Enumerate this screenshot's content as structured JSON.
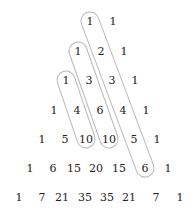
{
  "rows": [
    {
      "y": 21,
      "cells": [
        {
          "v": "1",
          "x": 90
        },
        {
          "v": "1",
          "x": 113
        }
      ]
    },
    {
      "y": 51,
      "cells": [
        {
          "v": "1",
          "x": 78
        },
        {
          "v": "2",
          "x": 101
        },
        {
          "v": "1",
          "x": 124
        }
      ]
    },
    {
      "y": 80,
      "cells": [
        {
          "v": "1",
          "x": 66
        },
        {
          "v": "3",
          "x": 89
        },
        {
          "v": "3",
          "x": 112
        },
        {
          "v": "1",
          "x": 135
        }
      ]
    },
    {
      "y": 110,
      "cells": [
        {
          "v": "1",
          "x": 54
        },
        {
          "v": "4",
          "x": 77
        },
        {
          "v": "6",
          "x": 100
        },
        {
          "v": "4",
          "x": 123
        },
        {
          "v": "1",
          "x": 146
        }
      ]
    },
    {
      "y": 139,
      "cells": [
        {
          "v": "1",
          "x": 42
        },
        {
          "v": "5",
          "x": 65
        },
        {
          "v": "10",
          "x": 86
        },
        {
          "v": "10",
          "x": 109
        },
        {
          "v": "5",
          "x": 134
        },
        {
          "v": "1",
          "x": 157
        }
      ]
    },
    {
      "y": 168,
      "cells": [
        {
          "v": "1",
          "x": 30
        },
        {
          "v": "6",
          "x": 53
        },
        {
          "v": "15",
          "x": 74
        },
        {
          "v": "20",
          "x": 96
        },
        {
          "v": "15",
          "x": 119
        },
        {
          "v": "6",
          "x": 145
        },
        {
          "v": "1",
          "x": 168
        }
      ]
    },
    {
      "y": 197,
      "cells": [
        {
          "v": "1",
          "x": 19
        },
        {
          "v": "7",
          "x": 42
        },
        {
          "v": "21",
          "x": 62
        },
        {
          "v": "35",
          "x": 85
        },
        {
          "v": "35",
          "x": 107
        },
        {
          "v": "21",
          "x": 129
        },
        {
          "v": "7",
          "x": 156
        },
        {
          "v": "1",
          "x": 180
        }
      ]
    }
  ],
  "loops": [
    {
      "from": [
        66,
        80
      ],
      "to": [
        86,
        139
      ]
    },
    {
      "from": [
        78,
        51
      ],
      "to": [
        109,
        139
      ]
    },
    {
      "from": [
        90,
        21
      ],
      "to": [
        145,
        168
      ]
    }
  ],
  "loop_color": "#b8b8b8"
}
